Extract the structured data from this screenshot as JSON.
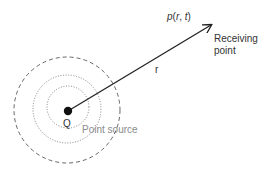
{
  "diagram": {
    "type": "point-source-propagation",
    "labels": {
      "pressure": "p(r, t)",
      "pressure_func": "p",
      "pressure_open": "(",
      "pressure_r": "r",
      "pressure_sep": ", ",
      "pressure_t": "t",
      "pressure_close": ")",
      "receiving_line1": "Receiving",
      "receiving_line2": "point",
      "distance": "r",
      "source_symbol": "Q",
      "source_label": "Point source"
    },
    "colors": {
      "line": "#222222",
      "dashed_circle": "#555555",
      "dotted_circle": "#777777",
      "source_label": "#8a8a8a",
      "text": "#333333"
    },
    "geometry": {
      "source_center": [
        68,
        111
      ],
      "circles": [
        {
          "r": 53,
          "style": "dashed"
        },
        {
          "r": 34,
          "style": "dotted"
        },
        {
          "r": 21,
          "style": "dotted"
        }
      ],
      "arrow_end": [
        211,
        25
      ]
    }
  }
}
